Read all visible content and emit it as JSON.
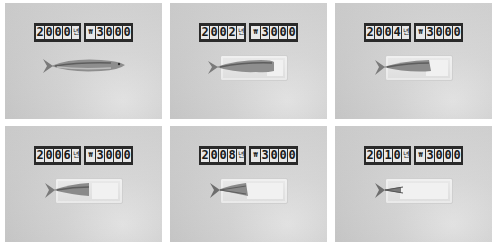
{
  "panels": [
    {
      "year": "2000",
      "unit": "년",
      "currency": "₩",
      "price": "3000",
      "fish_remaining": 1.0
    },
    {
      "year": "2002",
      "unit": "년",
      "currency": "₩",
      "price": "3000",
      "fish_remaining": 0.8
    },
    {
      "year": "2004",
      "unit": "년",
      "currency": "₩",
      "price": "3000",
      "fish_remaining": 0.65
    },
    {
      "year": "2006",
      "unit": "년",
      "currency": "₩",
      "price": "3000",
      "fish_remaining": 0.5
    },
    {
      "year": "2008",
      "unit": "년",
      "currency": "₩",
      "price": "3000",
      "fish_remaining": 0.35
    },
    {
      "year": "2010",
      "unit": "년",
      "currency": "₩",
      "price": "3000",
      "fish_remaining": 0.15
    }
  ],
  "colors": {
    "background": "#c9c9c9",
    "label_bg": "#2a2a2a",
    "label_cell": "#e8e8e8"
  }
}
